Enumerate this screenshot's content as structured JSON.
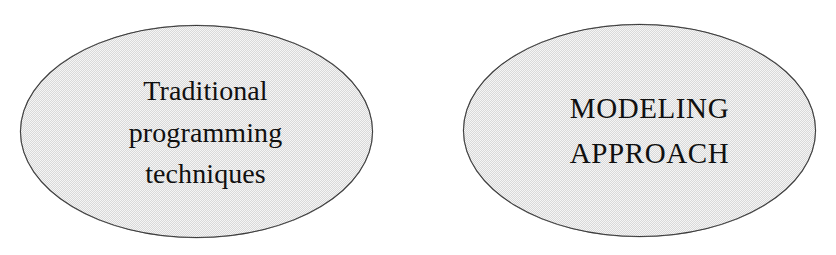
{
  "diagram": {
    "type": "ellipse-node-diagram",
    "background_color": "#ffffff",
    "node_fill_color": "#d9d9d9",
    "node_border_color": "#3a3a3a",
    "text_color": "#101010",
    "nodes": [
      {
        "id": "traditional-programming-techniques",
        "shape": "ellipse",
        "label_lines": [
          "Traditional",
          "programming",
          "techniques"
        ],
        "text_case": "mixed",
        "x": 20,
        "y": 25,
        "width": 353,
        "height": 213
      },
      {
        "id": "modeling-approach",
        "shape": "ellipse",
        "label_lines": [
          "MODELING",
          "APPROACH"
        ],
        "text_case": "uppercase",
        "x": 463,
        "y": 24,
        "width": 353,
        "height": 213
      }
    ]
  }
}
